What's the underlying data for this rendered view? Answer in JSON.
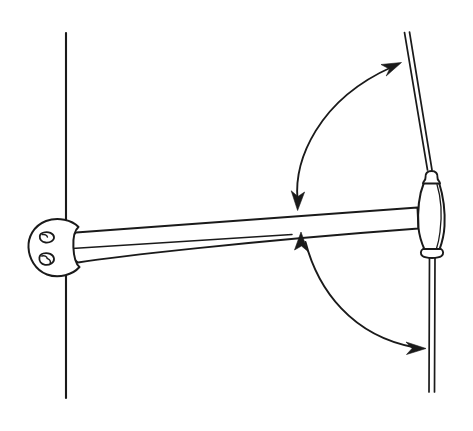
{
  "figure": {
    "domain": "line-drawing-diagram",
    "background_color": "#ffffff",
    "line_color": "#1a1a1a",
    "width": 473,
    "height": 431
  },
  "parts": {
    "wall_line": {
      "name": "wall-surface-line",
      "x": 66,
      "y_top": 33,
      "y_bottom": 398,
      "stroke_width": 2.0
    },
    "mounting_bracket": {
      "name": "wall-mount-bracket-plate",
      "center_x": 55,
      "center_y": 245,
      "rx": 26,
      "ry": 28,
      "screw_holes": 2,
      "screw_hole_positions": [
        {
          "cx": 48,
          "cy": 237,
          "r": 5
        },
        {
          "cx": 48,
          "cy": 257,
          "r": 5
        }
      ]
    },
    "support_arm": {
      "name": "tapered-support-arm",
      "left_x": 80,
      "left_y_top": 233,
      "left_y_bottom": 262,
      "right_x": 418,
      "right_y_top": 208,
      "right_y_bottom": 228,
      "highlight_line": true
    },
    "wand_handle": {
      "name": "wand-handle-body",
      "top_x": 430,
      "top_y": 173,
      "bottom_x": 432,
      "bottom_y": 256,
      "widest": 22,
      "top_knob": true,
      "bottom_knob": true
    },
    "upper_rod": {
      "name": "upper-tilt-rod",
      "x1": 405,
      "y1": 33,
      "x2": 430,
      "y2": 172,
      "thickness": 3
    },
    "lower_rod": {
      "name": "lower-tilt-rod",
      "x1": 432,
      "y1": 258,
      "x2": 433,
      "y2": 392,
      "thickness": 3
    }
  },
  "annotations": {
    "upper_arc_arrow": {
      "name": "upper-rotation-arrow",
      "type": "double-headed-curved-arrow",
      "start": {
        "x": 297,
        "y": 205
      },
      "end": {
        "x": 398,
        "y": 63
      },
      "control": {
        "x": 307,
        "y": 95
      },
      "meaning": "wand swings up toward raised position"
    },
    "lower_arc_arrow": {
      "name": "lower-rotation-arrow",
      "type": "double-headed-curved-arrow",
      "start": {
        "x": 303,
        "y": 236
      },
      "end": {
        "x": 425,
        "y": 348
      },
      "control": {
        "x": 330,
        "y": 345
      },
      "meaning": "wand swings down toward lowered position"
    }
  },
  "labels": {
    "caption": "",
    "text_items": []
  }
}
